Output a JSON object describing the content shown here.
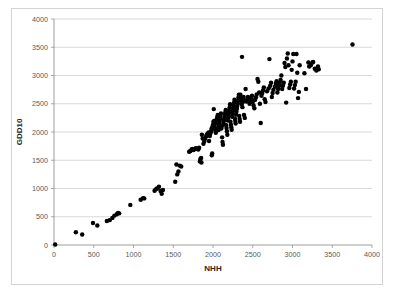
{
  "chart_data": {
    "type": "scatter",
    "title": "",
    "xlabel": "NHH",
    "ylabel": "GDD10",
    "xlim": [
      0,
      4000
    ],
    "ylim": [
      0,
      4000
    ],
    "xticks": [
      0,
      500,
      1000,
      1500,
      2000,
      2500,
      3000,
      3500,
      4000
    ],
    "yticks": [
      0,
      500,
      1000,
      1500,
      2000,
      2500,
      3000,
      3500,
      4000
    ],
    "xtick_labels": [
      "0",
      "500",
      "1000",
      "1500",
      "2000",
      "2500",
      "3000",
      "3500",
      "4000"
    ],
    "ytick_labels": [
      "0",
      "500",
      "1000",
      "1500",
      "2000",
      "2500",
      "3000",
      "3500",
      "4000"
    ],
    "grid": "horizontal",
    "legend": "none",
    "marker": "filled-circle",
    "marker_color": "#000000",
    "marker_size": 3,
    "series": [
      {
        "name": "NHH vs GDD10",
        "points": [
          [
            15,
            10
          ],
          [
            275,
            225
          ],
          [
            355,
            185
          ],
          [
            490,
            390
          ],
          [
            545,
            345
          ],
          [
            665,
            425
          ],
          [
            700,
            440
          ],
          [
            735,
            480
          ],
          [
            760,
            520
          ],
          [
            790,
            545
          ],
          [
            805,
            565
          ],
          [
            820,
            560
          ],
          [
            960,
            710
          ],
          [
            1090,
            800
          ],
          [
            1120,
            830
          ],
          [
            1135,
            825
          ],
          [
            1265,
            960
          ],
          [
            1280,
            985
          ],
          [
            1295,
            1000
          ],
          [
            1320,
            1030
          ],
          [
            1340,
            955
          ],
          [
            1355,
            905
          ],
          [
            1370,
            975
          ],
          [
            1525,
            1120
          ],
          [
            1540,
            1425
          ],
          [
            1550,
            1250
          ],
          [
            1565,
            1300
          ],
          [
            1580,
            1405
          ],
          [
            1600,
            1390
          ],
          [
            1700,
            1650
          ],
          [
            1715,
            1665
          ],
          [
            1730,
            1690
          ],
          [
            1740,
            1700
          ],
          [
            1755,
            1680
          ],
          [
            1770,
            1700
          ],
          [
            1785,
            1715
          ],
          [
            1800,
            1705
          ],
          [
            1815,
            1690
          ],
          [
            1825,
            1720
          ],
          [
            1835,
            1480
          ],
          [
            1840,
            1520
          ],
          [
            1850,
            1540
          ],
          [
            1855,
            1460
          ],
          [
            1860,
            1950
          ],
          [
            1870,
            1885
          ],
          [
            1880,
            1790
          ],
          [
            1890,
            1830
          ],
          [
            1895,
            1870
          ],
          [
            1905,
            1900
          ],
          [
            1915,
            1930
          ],
          [
            1925,
            1955
          ],
          [
            1935,
            1975
          ],
          [
            1945,
            1990
          ],
          [
            1950,
            1840
          ],
          [
            1960,
            1930
          ],
          [
            1965,
            1965
          ],
          [
            1975,
            2005
          ],
          [
            1980,
            2055
          ],
          [
            1985,
            1590
          ],
          [
            1990,
            1620
          ],
          [
            1995,
            2100
          ],
          [
            2000,
            2130
          ],
          [
            2005,
            2180
          ],
          [
            2010,
            2405
          ],
          [
            2015,
            2195
          ],
          [
            2020,
            2090
          ],
          [
            2025,
            2060
          ],
          [
            2030,
            2020
          ],
          [
            2035,
            1985
          ],
          [
            2040,
            2155
          ],
          [
            2045,
            2215
          ],
          [
            2050,
            2240
          ],
          [
            2055,
            2270
          ],
          [
            2060,
            2300
          ],
          [
            2065,
            2080
          ],
          [
            2070,
            2035
          ],
          [
            2075,
            2115
          ],
          [
            2080,
            2160
          ],
          [
            2085,
            2200
          ],
          [
            2090,
            2245
          ],
          [
            2095,
            2285
          ],
          [
            2100,
            2330
          ],
          [
            2105,
            2060
          ],
          [
            2110,
            2100
          ],
          [
            2115,
            1905
          ],
          [
            2120,
            1825
          ],
          [
            2125,
            1775
          ],
          [
            2130,
            2140
          ],
          [
            2135,
            2185
          ],
          [
            2140,
            2225
          ],
          [
            2145,
            2265
          ],
          [
            2150,
            2310
          ],
          [
            2155,
            2350
          ],
          [
            2160,
            2390
          ],
          [
            2165,
            2120
          ],
          [
            2170,
            2070
          ],
          [
            2175,
            2015
          ],
          [
            2180,
            1950
          ],
          [
            2185,
            2205
          ],
          [
            2190,
            2250
          ],
          [
            2195,
            2295
          ],
          [
            2200,
            2340
          ],
          [
            2205,
            2390
          ],
          [
            2210,
            2440
          ],
          [
            2215,
            2490
          ],
          [
            2220,
            2180
          ],
          [
            2225,
            2130
          ],
          [
            2230,
            2085
          ],
          [
            2235,
            2040
          ],
          [
            2240,
            2270
          ],
          [
            2245,
            2320
          ],
          [
            2250,
            2370
          ],
          [
            2255,
            2420
          ],
          [
            2260,
            2470
          ],
          [
            2265,
            2520
          ],
          [
            2270,
            2570
          ],
          [
            2275,
            2240
          ],
          [
            2280,
            2195
          ],
          [
            2285,
            2150
          ],
          [
            2290,
            2310
          ],
          [
            2295,
            2360
          ],
          [
            2300,
            2410
          ],
          [
            2305,
            2460
          ],
          [
            2310,
            2510
          ],
          [
            2315,
            2560
          ],
          [
            2320,
            2610
          ],
          [
            2325,
            2660
          ],
          [
            2330,
            2285
          ],
          [
            2335,
            2230
          ],
          [
            2340,
            2180
          ],
          [
            2345,
            2660
          ],
          [
            2350,
            2555
          ],
          [
            2355,
            2600
          ],
          [
            2360,
            2490
          ],
          [
            2365,
            3330
          ],
          [
            2370,
            2440
          ],
          [
            2375,
            2530
          ],
          [
            2380,
            2575
          ],
          [
            2385,
            2620
          ],
          [
            2390,
            2300
          ],
          [
            2400,
            2250
          ],
          [
            2410,
            2760
          ],
          [
            2420,
            2540
          ],
          [
            2430,
            2580
          ],
          [
            2440,
            2620
          ],
          [
            2450,
            2560
          ],
          [
            2460,
            2500
          ],
          [
            2470,
            2545
          ],
          [
            2480,
            2595
          ],
          [
            2490,
            2640
          ],
          [
            2500,
            2530
          ],
          [
            2510,
            2470
          ],
          [
            2520,
            2420
          ],
          [
            2530,
            2570
          ],
          [
            2540,
            2615
          ],
          [
            2550,
            2665
          ],
          [
            2560,
            2940
          ],
          [
            2570,
            2890
          ],
          [
            2580,
            2700
          ],
          [
            2590,
            2500
          ],
          [
            2600,
            2160
          ],
          [
            2610,
            2640
          ],
          [
            2620,
            2690
          ],
          [
            2630,
            2740
          ],
          [
            2640,
            2790
          ],
          [
            2650,
            2580
          ],
          [
            2660,
            2530
          ],
          [
            2680,
            2720
          ],
          [
            2700,
            2770
          ],
          [
            2710,
            3290
          ],
          [
            2720,
            2820
          ],
          [
            2730,
            2870
          ],
          [
            2740,
            2620
          ],
          [
            2750,
            2690
          ],
          [
            2760,
            2750
          ],
          [
            2780,
            2800
          ],
          [
            2790,
            2855
          ],
          [
            2800,
            2900
          ],
          [
            2810,
            2700
          ],
          [
            2820,
            2760
          ],
          [
            2830,
            2820
          ],
          [
            2840,
            2870
          ],
          [
            2850,
            2920
          ],
          [
            2860,
            3000
          ],
          [
            2870,
            2760
          ],
          [
            2880,
            2820
          ],
          [
            2890,
            2870
          ],
          [
            2900,
            3220
          ],
          [
            2910,
            3150
          ],
          [
            2920,
            2520
          ],
          [
            2930,
            3300
          ],
          [
            2940,
            3390
          ],
          [
            2950,
            3180
          ],
          [
            2960,
            2780
          ],
          [
            2970,
            2840
          ],
          [
            2980,
            2890
          ],
          [
            2990,
            3100
          ],
          [
            3000,
            3250
          ],
          [
            3010,
            3380
          ],
          [
            3020,
            2770
          ],
          [
            3030,
            2830
          ],
          [
            3040,
            2890
          ],
          [
            3050,
            3380
          ],
          [
            3060,
            3050
          ],
          [
            3070,
            2600
          ],
          [
            3080,
            2710
          ],
          [
            3090,
            3180
          ],
          [
            3150,
            3040
          ],
          [
            3170,
            2760
          ],
          [
            3200,
            3230
          ],
          [
            3210,
            3160
          ],
          [
            3230,
            3180
          ],
          [
            3250,
            3230
          ],
          [
            3260,
            3240
          ],
          [
            3280,
            3120
          ],
          [
            3300,
            3090
          ],
          [
            3320,
            3160
          ],
          [
            3330,
            3110
          ],
          [
            3755,
            3550
          ]
        ]
      }
    ]
  }
}
